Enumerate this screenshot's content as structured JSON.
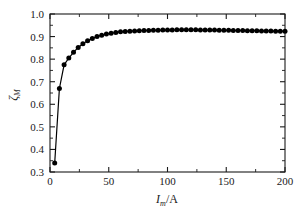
{
  "chart_data": {
    "type": "line",
    "title": "",
    "subtitle": "",
    "xlabel": "I_m/A",
    "xlabel_parts": {
      "symbol": "I",
      "subscript": "m",
      "unit": "/A"
    },
    "ylabel": "ζ_M",
    "ylabel_parts": {
      "symbol": "ζ",
      "subscript": "M"
    },
    "xlim": [
      0,
      200
    ],
    "ylim": [
      0.3,
      1.0
    ],
    "xticks": [
      0,
      50,
      100,
      150,
      200
    ],
    "xtick_labels": [
      "0",
      "50",
      "100",
      "150",
      "200"
    ],
    "xminor_interval": 25,
    "yticks": [
      0.3,
      0.4,
      0.5,
      0.6,
      0.7,
      0.8,
      0.9,
      1.0
    ],
    "ytick_labels": [
      "0.3",
      "0.4",
      "0.5",
      "0.6",
      "0.7",
      "0.8",
      "0.9",
      "1.0"
    ],
    "yminor_interval": 0.05,
    "grid": false,
    "legend": false,
    "legend_position": "none",
    "marker": "filled-circle",
    "marker_color": "#000000",
    "line_color": "#000000",
    "series": [
      {
        "name": "zeta_M",
        "x": [
          4,
          8,
          12,
          16,
          20,
          24,
          28,
          32,
          36,
          40,
          44,
          48,
          52,
          56,
          60,
          64,
          68,
          72,
          76,
          80,
          84,
          88,
          92,
          96,
          100,
          104,
          108,
          112,
          116,
          120,
          124,
          128,
          132,
          136,
          140,
          144,
          148,
          152,
          156,
          160,
          164,
          168,
          172,
          176,
          180,
          184,
          188,
          192,
          196,
          200
        ],
        "values": [
          0.34,
          0.67,
          0.775,
          0.805,
          0.83,
          0.852,
          0.868,
          0.881,
          0.892,
          0.9,
          0.906,
          0.911,
          0.915,
          0.918,
          0.921,
          0.923,
          0.924,
          0.925,
          0.926,
          0.927,
          0.927,
          0.928,
          0.928,
          0.929,
          0.929,
          0.929,
          0.93,
          0.93,
          0.93,
          0.93,
          0.93,
          0.929,
          0.929,
          0.929,
          0.929,
          0.928,
          0.928,
          0.928,
          0.927,
          0.927,
          0.927,
          0.926,
          0.926,
          0.926,
          0.925,
          0.925,
          0.925,
          0.924,
          0.924,
          0.924
        ]
      }
    ]
  },
  "plot_geometry": {
    "left": 50,
    "right": 285,
    "top": 14,
    "bottom": 172
  }
}
